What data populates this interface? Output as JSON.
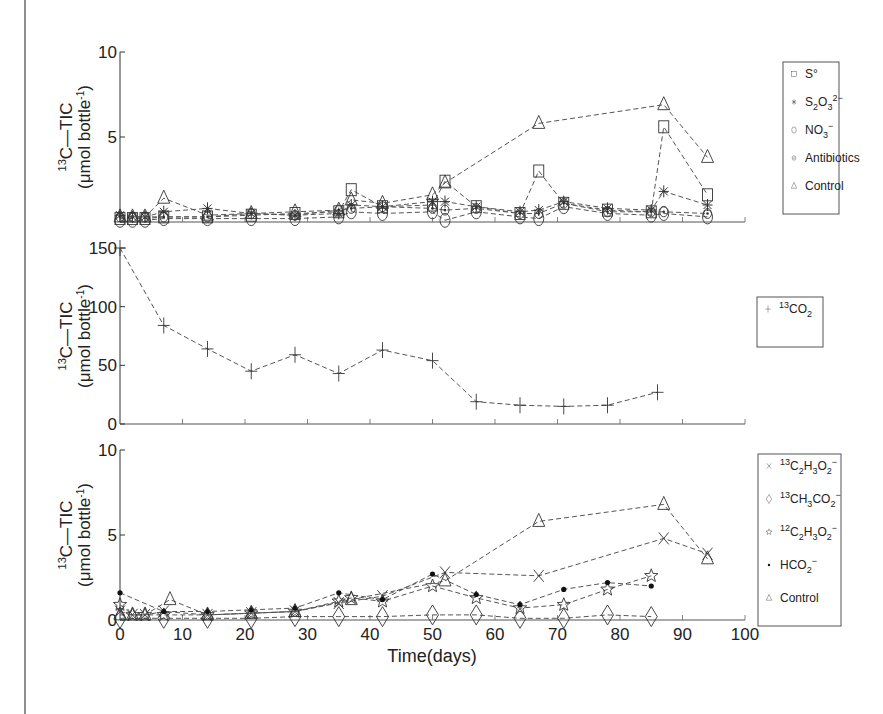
{
  "chart_data": [
    {
      "type": "line",
      "panel": "top",
      "ylabel_line1": "13C—TIC",
      "ylabel_sup": "13",
      "ylabel_main": "C—TIC",
      "ylabel_line2_pre": "(μmol bottle",
      "ylabel_line2_sup": "-1",
      "ylabel_line2_post": ")",
      "xlabel": "",
      "xlim": [
        0,
        100
      ],
      "ylim": [
        0,
        10
      ],
      "yticks": [
        0,
        5,
        10
      ],
      "ytick_labels": [
        "",
        "5",
        "10"
      ],
      "legend_position": "right",
      "series": [
        {
          "name": "S°",
          "label_main": "S°",
          "marker": "square",
          "x": [
            0,
            2,
            4,
            7,
            14,
            21,
            28,
            35,
            37,
            42,
            50,
            52,
            57,
            64,
            67,
            71,
            78,
            85,
            87,
            94
          ],
          "y": [
            0.2,
            0.2,
            0.2,
            0.3,
            0.3,
            0.4,
            0.5,
            0.6,
            1.9,
            0.9,
            1.0,
            2.4,
            0.9,
            0.5,
            3.0,
            1.1,
            0.7,
            0.6,
            5.6,
            1.6
          ]
        },
        {
          "name": "S2O3 2-",
          "label_main": "S",
          "label_sub1": "2",
          "label_mid": "O",
          "label_sub2": "3",
          "label_sup": "2−",
          "marker": "asterisk",
          "x": [
            0,
            2,
            4,
            7,
            14,
            21,
            28,
            35,
            37,
            42,
            50,
            52,
            57,
            64,
            67,
            71,
            78,
            85,
            87,
            94
          ],
          "y": [
            0.4,
            0.3,
            0.3,
            0.6,
            0.8,
            0.5,
            0.4,
            0.5,
            1.0,
            0.9,
            1.2,
            1.2,
            0.9,
            0.6,
            0.7,
            1.2,
            0.8,
            0.7,
            1.8,
            1.0
          ]
        },
        {
          "name": "NO3-",
          "label_main": "NO",
          "label_sub1": "3",
          "label_sup": "−",
          "marker": "circle",
          "x": [
            0,
            2,
            4,
            7,
            14,
            21,
            28,
            35,
            37,
            42,
            50,
            52,
            57,
            64,
            67,
            71,
            78,
            85,
            87,
            94
          ],
          "y": [
            0.1,
            0.1,
            0.1,
            0.2,
            0.2,
            0.2,
            0.2,
            0.3,
            0.6,
            0.5,
            0.6,
            0.1,
            0.6,
            0.3,
            0.2,
            0.9,
            0.5,
            0.4,
            0.5,
            0.3
          ]
        },
        {
          "name": "Antibiotics",
          "label_main": "Antibiotics",
          "marker": "dotcircle",
          "x": [
            0,
            2,
            4,
            7,
            14,
            21,
            28,
            35,
            37,
            42,
            50,
            52,
            57,
            64,
            67,
            71,
            78,
            85,
            87,
            94
          ],
          "y": [
            0.3,
            0.3,
            0.3,
            0.3,
            0.3,
            0.5,
            0.4,
            0.7,
            0.8,
            0.9,
            0.8,
            0.7,
            0.8,
            0.5,
            0.5,
            1.1,
            0.6,
            0.6,
            0.6,
            0.5
          ]
        },
        {
          "name": "Control",
          "label_main": "Control",
          "marker": "triangle",
          "x": [
            0,
            2,
            4,
            7,
            14,
            21,
            28,
            35,
            37,
            42,
            50,
            52,
            67,
            87,
            94
          ],
          "y": [
            0.3,
            0.3,
            0.3,
            1.4,
            0.4,
            0.5,
            0.6,
            0.7,
            1.3,
            1.1,
            1.6,
            2.3,
            5.8,
            6.9,
            3.8
          ]
        }
      ]
    },
    {
      "type": "line",
      "panel": "middle",
      "xlim": [
        0,
        100
      ],
      "ylim": [
        0,
        150
      ],
      "yticks": [
        0,
        50,
        100,
        150
      ],
      "ytick_labels": [
        "0",
        "50",
        "100",
        "150"
      ],
      "legend_position": "right",
      "series": [
        {
          "name": "13CO2",
          "label_sup_pre": "13",
          "label_main": "CO",
          "label_sub1": "2",
          "marker": "plus",
          "x": [
            0,
            7,
            14,
            21,
            28,
            35,
            42,
            50,
            57,
            64,
            71,
            78,
            86
          ],
          "y": [
            150,
            84,
            64,
            45,
            59,
            43,
            63,
            54,
            19,
            16,
            15,
            16,
            27
          ]
        }
      ]
    },
    {
      "type": "line",
      "panel": "bottom",
      "xlabel": "Time(days)",
      "xlim": [
        0,
        100
      ],
      "xticks": [
        0,
        10,
        20,
        30,
        40,
        50,
        60,
        70,
        80,
        90,
        100
      ],
      "xtick_labels": [
        "0",
        "10",
        "20",
        "30",
        "40",
        "50",
        "60",
        "70",
        "80",
        "90",
        "100"
      ],
      "ylim": [
        0,
        10
      ],
      "yticks": [
        0,
        5,
        10
      ],
      "ytick_labels": [
        "0",
        "5",
        "10"
      ],
      "legend_position": "right",
      "series": [
        {
          "name": "13C2H3O2-",
          "label_sup_pre": "13",
          "label_main": "C",
          "label_sub1": "2",
          "label_mid": "H",
          "label_sub2": "3",
          "label_mid2": "O",
          "label_sub3": "2",
          "label_sup": "−",
          "marker": "x",
          "x": [
            0,
            2,
            4,
            7,
            14,
            21,
            28,
            35,
            42,
            52,
            67,
            87,
            94
          ],
          "y": [
            0.5,
            0.3,
            0.3,
            0.5,
            0.3,
            0.4,
            0.5,
            1.0,
            1.4,
            2.8,
            2.6,
            4.8,
            3.9
          ]
        },
        {
          "name": "13CH3CO2-",
          "label_sup_pre": "13",
          "label_main": "CH",
          "label_sub1": "3",
          "label_mid": "CO",
          "label_sub2": "2",
          "label_sup": "−",
          "marker": "diamond",
          "x": [
            0,
            7,
            14,
            21,
            28,
            35,
            42,
            50,
            57,
            64,
            71,
            78,
            85
          ],
          "y": [
            0.1,
            0.1,
            0.1,
            0.1,
            0.2,
            0.2,
            0.2,
            0.3,
            0.3,
            0.1,
            0.1,
            0.3,
            0.2
          ]
        },
        {
          "name": "12C2H3O2-",
          "label_sup_pre": "12",
          "label_main": "C",
          "label_sub1": "2",
          "label_mid": "H",
          "label_sub2": "3",
          "label_mid2": "O",
          "label_sub3": "2",
          "label_sup": "−",
          "marker": "star",
          "x": [
            0,
            2,
            4,
            7,
            14,
            21,
            28,
            35,
            37,
            42,
            50,
            57,
            64,
            71,
            78,
            85
          ],
          "y": [
            0.9,
            0.3,
            0.3,
            0.3,
            0.3,
            0.4,
            0.5,
            1.1,
            1.3,
            1.1,
            2.0,
            1.3,
            0.7,
            0.9,
            1.8,
            2.6
          ]
        },
        {
          "name": "HCO2-",
          "label_main": "HCO",
          "label_sub1": "2",
          "label_sup": "−",
          "marker": "dot",
          "x": [
            0,
            7,
            14,
            21,
            28,
            35,
            42,
            50,
            57,
            64,
            71,
            78,
            85
          ],
          "y": [
            1.6,
            0.5,
            0.5,
            0.6,
            0.7,
            1.6,
            1.2,
            2.7,
            1.5,
            0.9,
            1.8,
            2.2,
            2.0
          ]
        },
        {
          "name": "Control",
          "label_main": "Control",
          "marker": "triangle",
          "x": [
            0,
            2,
            4,
            8,
            14,
            21,
            28,
            37,
            52,
            67,
            87,
            94
          ],
          "y": [
            0.3,
            0.3,
            0.3,
            1.2,
            0.3,
            0.4,
            0.5,
            1.2,
            2.3,
            5.8,
            6.8,
            3.6
          ]
        }
      ]
    }
  ]
}
